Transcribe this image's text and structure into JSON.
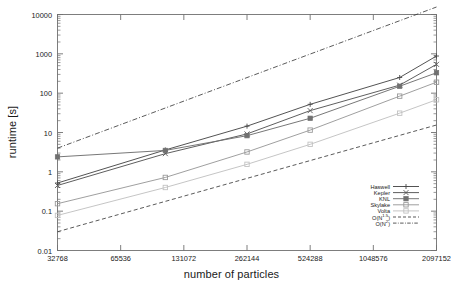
{
  "chart_data": {
    "type": "line",
    "title": "",
    "xlabel": "number of particles",
    "ylabel": "runtime [s]",
    "xscale": "log",
    "yscale": "log",
    "xlim": [
      32768,
      2097152
    ],
    "ylim": [
      0.01,
      10000
    ],
    "grid": false,
    "legend_position": "bottom-right",
    "xticks": [
      32768,
      65536,
      131072,
      262144,
      524288,
      1048576,
      2097152
    ],
    "xtick_labels": [
      "32768",
      "65536",
      "131072",
      "262144",
      "524288",
      "1048576",
      "2097152"
    ],
    "yticks": [
      0.01,
      0.1,
      1,
      10,
      100,
      1000,
      10000
    ],
    "ytick_labels": [
      "0.01",
      "0.1",
      "1",
      "10",
      "100",
      "1000",
      "10000"
    ],
    "x": [
      32768,
      107000,
      262144,
      524288,
      1400000,
      2097152
    ],
    "series": [
      {
        "name": "Haswell",
        "marker": "plus",
        "color": "#4a4a4a",
        "linestyle": "solid",
        "x": [
          32768,
          107000,
          262144,
          524288,
          1400000,
          2097152
        ],
        "values": [
          0.52,
          3.6,
          14.5,
          52,
          250,
          880
        ]
      },
      {
        "name": "Kepler",
        "marker": "cross",
        "color": "#555555",
        "linestyle": "solid",
        "x": [
          32768,
          107000,
          262144,
          524288,
          1400000,
          2097152
        ],
        "values": [
          0.45,
          2.9,
          9.2,
          36,
          160,
          540
        ]
      },
      {
        "name": "KNL",
        "marker": "filled-square",
        "color": "#707070",
        "linestyle": "solid",
        "x": [
          32768,
          107000,
          262144,
          524288,
          1400000,
          2097152
        ],
        "values": [
          2.4,
          3.5,
          8.3,
          23,
          150,
          330
        ]
      },
      {
        "name": "Skylake",
        "marker": "open-square",
        "color": "#9a9a9a",
        "linestyle": "solid",
        "x": [
          32768,
          107000,
          262144,
          524288,
          1400000,
          2097152
        ],
        "values": [
          0.155,
          0.72,
          3.2,
          11.5,
          84,
          190
        ]
      },
      {
        "name": "Volta",
        "marker": "light-square",
        "color": "#c2c2c2",
        "linestyle": "solid",
        "x": [
          32768,
          107000,
          262144,
          524288,
          1400000,
          2097152
        ],
        "values": [
          0.078,
          0.4,
          1.55,
          5.0,
          31,
          68
        ]
      },
      {
        "name": "O(N^1.5)",
        "label_base": "O(N",
        "label_exp": "1.5",
        "label_tail": ")",
        "marker": "none",
        "color": "#3c3c3c",
        "linestyle": "dashed",
        "x": [
          32768,
          2097152
        ],
        "values": [
          0.03,
          15.5
        ]
      },
      {
        "name": "O(N^2)",
        "label_base": "O(N",
        "label_exp": "2",
        "label_tail": ")",
        "marker": "none",
        "color": "#3c3c3c",
        "linestyle": "dashdot",
        "x": [
          32768,
          2097152
        ],
        "values": [
          4.0,
          15500
        ]
      }
    ]
  },
  "axes": {
    "x_title": "number of particles",
    "y_title": "runtime [s]"
  },
  "legend": {
    "entries": [
      {
        "label": "Haswell"
      },
      {
        "label": "Kepler"
      },
      {
        "label": "KNL"
      },
      {
        "label": "Skylake"
      },
      {
        "label": "Volta"
      },
      {
        "label": "O(N1.5)"
      },
      {
        "label": "O(N2)"
      }
    ]
  },
  "colors": {
    "frame": "#707070",
    "background": "#ffffff",
    "text": "#1a1a1a"
  }
}
